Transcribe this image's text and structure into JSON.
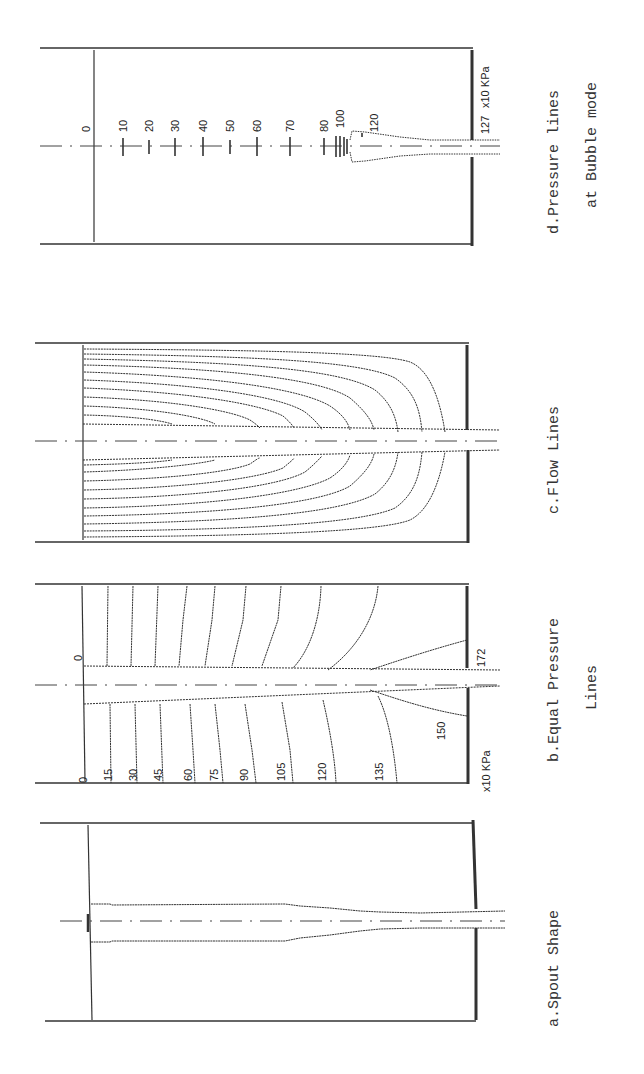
{
  "figure": {
    "orientation": "rotated 90 degrees counter-clockwise",
    "panels": [
      {
        "id": "a",
        "caption_line1": "a.Spout  Shape",
        "caption_line2": ""
      },
      {
        "id": "b",
        "caption_line1": "b.Equal Pressure",
        "caption_line2": "Lines",
        "contour_labels": [
          "0",
          "15",
          "30",
          "45",
          "60",
          "75",
          "90",
          "105",
          "120",
          "135",
          "150"
        ],
        "spout_start_label": "0",
        "outlet_label": "172",
        "unit_label": "x10 KPa"
      },
      {
        "id": "c",
        "caption_line1": "c.Flow Lines",
        "caption_line2": ""
      },
      {
        "id": "d",
        "caption_line1": "d.Pressure lines",
        "caption_line2": "at Bubble mode",
        "pressure_labels": [
          "0",
          "10",
          "20",
          "30",
          "40",
          "50",
          "60",
          "70",
          "80",
          "100",
          "120"
        ],
        "outlet_label": "127",
        "unit_label": "x10 KPa"
      }
    ]
  },
  "captions": {
    "a": "a.Spout  Shape",
    "b1": "b.Equal Pressure",
    "b2": "Lines",
    "c": "c.Flow Lines",
    "d1": "d.Pressure lines",
    "d2": "at Bubble mode"
  },
  "panel_b": {
    "labels": [
      "0",
      "15",
      "30",
      "45",
      "60",
      "75",
      "90",
      "105",
      "120",
      "135"
    ],
    "label_150": "150",
    "label_172": "172",
    "label_zero_spout": "0",
    "unit": "x10 KPa"
  },
  "panel_d": {
    "labels": [
      "0",
      "10",
      "20",
      "30",
      "40",
      "50",
      "60",
      "70",
      "80",
      "100",
      "120"
    ],
    "label_127": "127",
    "unit": "x10 KPa"
  }
}
